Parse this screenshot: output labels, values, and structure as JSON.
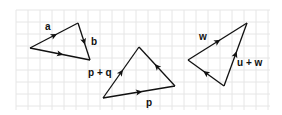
{
  "diagram": {
    "grid": {
      "x0": 16,
      "y0": 10,
      "x1": 270,
      "y1": 110,
      "step": 12,
      "color": "#e6e6e6"
    },
    "stroke_color": "#111111",
    "triangles": [
      {
        "name": "triangle-ab",
        "vertices": [
          [
            30,
            48
          ],
          [
            78,
            23
          ],
          [
            90,
            60
          ]
        ],
        "edges": [
          {
            "from": [
              30,
              48
            ],
            "to": [
              78,
              23
            ],
            "label": "a",
            "label_pos": [
              45,
              30
            ]
          },
          {
            "from": [
              78,
              23
            ],
            "to": [
              90,
              60
            ],
            "label": "b",
            "label_pos": [
              91,
              45
            ]
          },
          {
            "from": [
              30,
              48
            ],
            "to": [
              90,
              60
            ],
            "label": "",
            "label_pos": null
          }
        ]
      },
      {
        "name": "triangle-pq",
        "vertices": [
          [
            103,
            98
          ],
          [
            139,
            47
          ],
          [
            175,
            86
          ]
        ],
        "edges": [
          {
            "from": [
              103,
              98
            ],
            "to": [
              139,
              47
            ],
            "label": "p + q",
            "label_pos": [
              88,
              76
            ]
          },
          {
            "from": [
              103,
              98
            ],
            "to": [
              175,
              86
            ],
            "label": "p",
            "label_pos": [
              146,
              106
            ]
          },
          {
            "from": [
              175,
              86
            ],
            "to": [
              139,
              47
            ],
            "label": "",
            "label_pos": null
          }
        ]
      },
      {
        "name": "triangle-uw",
        "vertices": [
          [
            188,
            60
          ],
          [
            247,
            23
          ],
          [
            224,
            86
          ]
        ],
        "edges": [
          {
            "from": [
              188,
              60
            ],
            "to": [
              247,
              23
            ],
            "label": "w",
            "label_pos": [
              199,
              40
            ]
          },
          {
            "from": [
              224,
              86
            ],
            "to": [
              247,
              23
            ],
            "label": "u + w",
            "label_pos": [
              237,
              66
            ]
          },
          {
            "from": [
              224,
              86
            ],
            "to": [
              188,
              60
            ],
            "label": "",
            "label_pos": null
          }
        ]
      }
    ]
  }
}
